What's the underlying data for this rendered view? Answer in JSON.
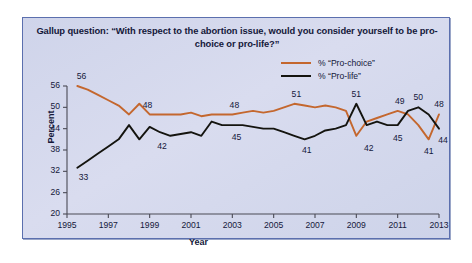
{
  "figure": {
    "title": "Gallup question: “With respect to the abortion issue, would you consider yourself to be pro-choice or pro-life?”",
    "panel_bg": "#d3d8ec",
    "panel_border": "#5b6fae"
  },
  "legend": {
    "position": "top-right",
    "items": [
      {
        "label": "% “Pro-choice”",
        "color": "#c4672e"
      },
      {
        "label": "% “Pro-life”",
        "color": "#14140f"
      }
    ]
  },
  "chart_data": {
    "type": "line",
    "title": "Gallup question: “With respect to the abortion issue, would you consider yourself to be pro-choice or pro-life?”",
    "xlabel": "Year",
    "ylabel": "Percent",
    "xlim": [
      1995,
      2013
    ],
    "ylim": [
      20,
      56
    ],
    "xticks": [
      1995,
      1997,
      1999,
      2001,
      2003,
      2005,
      2007,
      2009,
      2011,
      2013
    ],
    "yticks": [
      20,
      26,
      32,
      38,
      44,
      50,
      56
    ],
    "grid": false,
    "legend_position": "top-right",
    "x": [
      1995.5,
      1996,
      1996.5,
      1997,
      1997.5,
      1998,
      1998.5,
      1999,
      1999.5,
      2000,
      2000.5,
      2001,
      2001.5,
      2002,
      2002.5,
      2003,
      2003.5,
      2004,
      2004.5,
      2005,
      2005.5,
      2006,
      2006.5,
      2007,
      2007.5,
      2008,
      2008.5,
      2009,
      2009.5,
      2010,
      2010.5,
      2011,
      2011.5,
      2012,
      2012.5,
      2013
    ],
    "series": [
      {
        "name": "% “Pro-choice”",
        "color": "#c4672e",
        "values": [
          56,
          55,
          53.5,
          52,
          50.5,
          48,
          51,
          48,
          48,
          48,
          48,
          48.5,
          47.5,
          48,
          48,
          48,
          48.5,
          49,
          48.5,
          49,
          50,
          51,
          50.5,
          50,
          50.5,
          50,
          49,
          42,
          46,
          47,
          48,
          49,
          48,
          45,
          41,
          48
        ]
      },
      {
        "name": "% “Pro-life”",
        "color": "#14140f",
        "values": [
          33,
          35,
          37,
          39,
          41,
          45,
          41,
          44.5,
          43,
          42,
          42.5,
          43,
          42,
          46,
          45,
          45,
          45,
          44.5,
          44,
          44,
          43,
          42,
          41,
          42,
          43.5,
          44,
          45,
          51,
          45,
          46,
          45,
          45,
          49,
          50,
          48,
          44
        ]
      }
    ],
    "point_labels": [
      {
        "text": "56",
        "x": 1995.7,
        "y": 58.5,
        "series": "pro-choice"
      },
      {
        "text": "48",
        "x": 1998.9,
        "y": 50.5,
        "series": "pro-choice"
      },
      {
        "text": "48",
        "x": 2003.1,
        "y": 50.5,
        "series": "pro-choice"
      },
      {
        "text": "51",
        "x": 2006.1,
        "y": 53.4,
        "series": "pro-choice"
      },
      {
        "text": "51",
        "x": 2009.0,
        "y": 53.6,
        "series": "pro-life"
      },
      {
        "text": "49",
        "x": 2011.1,
        "y": 51.4,
        "series": "pro-choice"
      },
      {
        "text": "50",
        "x": 2012.0,
        "y": 52.6,
        "series": "pro-life"
      },
      {
        "text": "48",
        "x": 2013.0,
        "y": 50.6,
        "series": "pro-choice"
      },
      {
        "text": "33",
        "x": 1995.8,
        "y": 30.0,
        "series": "pro-life"
      },
      {
        "text": "42",
        "x": 1999.6,
        "y": 38.8,
        "series": "pro-life"
      },
      {
        "text": "45",
        "x": 2003.2,
        "y": 41.4,
        "series": "pro-life"
      },
      {
        "text": "41",
        "x": 2006.6,
        "y": 37.8,
        "series": "pro-life"
      },
      {
        "text": "42",
        "x": 2009.6,
        "y": 38.4,
        "series": "pro-choice"
      },
      {
        "text": "45",
        "x": 2011.0,
        "y": 41.0,
        "series": "pro-life"
      },
      {
        "text": "41",
        "x": 2012.5,
        "y": 37.4,
        "series": "pro-choice"
      },
      {
        "text": "44",
        "x": 2013.2,
        "y": 40.6,
        "series": "pro-life"
      }
    ]
  }
}
